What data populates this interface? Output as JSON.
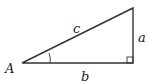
{
  "diagram": {
    "type": "right-triangle",
    "vertices": {
      "A": {
        "x": 22,
        "y": 63
      },
      "right_angle": {
        "x": 133,
        "y": 63
      },
      "top": {
        "x": 133,
        "y": 8
      }
    },
    "labels": {
      "vertex_A": "A",
      "hypotenuse": "c",
      "opposite": "a",
      "adjacent": "b"
    },
    "angle_marker_at": "A",
    "right_angle_marker": true,
    "stroke_color": "#333333"
  }
}
